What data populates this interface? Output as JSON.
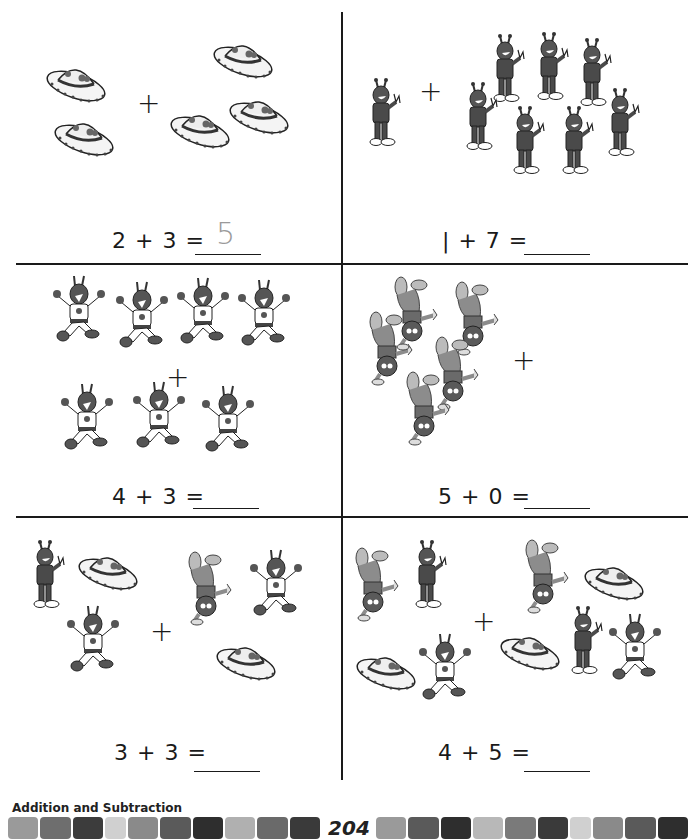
{
  "page": {
    "section_title": "Addition and Subtraction",
    "page_number": "204"
  },
  "problems": [
    {
      "id": 1,
      "equation": "2 + 3 =",
      "answer": "5",
      "left_items": [
        "ufo",
        "ufo"
      ],
      "right_items": [
        "ufo",
        "ufo",
        "ufo"
      ],
      "left_count": 2,
      "right_count": 3
    },
    {
      "id": 2,
      "equation": "| + 7 =",
      "answer": "",
      "left_items": [
        "waving-alien"
      ],
      "right_items": [
        "waving-alien",
        "waving-alien",
        "waving-alien",
        "waving-alien",
        "waving-alien",
        "waving-alien",
        "waving-alien"
      ],
      "left_count": 1,
      "right_count": 7
    },
    {
      "id": 3,
      "equation": "4 + 3 =",
      "answer": "",
      "left_items": [
        "jumping-alien",
        "jumping-alien",
        "jumping-alien",
        "jumping-alien"
      ],
      "right_items": [
        "jumping-alien",
        "jumping-alien",
        "jumping-alien"
      ],
      "left_count": 4,
      "right_count": 3
    },
    {
      "id": 4,
      "equation": "5 + 0 =",
      "answer": "",
      "left_items": [
        "handstand-alien",
        "handstand-alien",
        "handstand-alien",
        "handstand-alien",
        "handstand-alien"
      ],
      "right_items": [],
      "left_count": 5,
      "right_count": 0
    },
    {
      "id": 5,
      "equation": "3 + 3 =",
      "answer": "",
      "left_items": [
        "waving-alien",
        "ufo",
        "jumping-alien"
      ],
      "right_items": [
        "handstand-alien",
        "jumping-alien",
        "ufo"
      ],
      "left_count": 3,
      "right_count": 3
    },
    {
      "id": 6,
      "equation": "4 + 5 =",
      "answer": "",
      "left_items": [
        "handstand-alien",
        "waving-alien",
        "ufo",
        "jumping-alien"
      ],
      "right_items": [
        "handstand-alien",
        "ufo",
        "ufo",
        "waving-alien",
        "jumping-alien"
      ],
      "left_count": 4,
      "right_count": 5
    }
  ],
  "symbols": {
    "plus": "+"
  },
  "colors": {
    "ink": "#1a1a1a",
    "alien_dark": "#4a4a4a",
    "alien_light": "#8c8c8c",
    "traced_answer": "#9a9a9a"
  }
}
